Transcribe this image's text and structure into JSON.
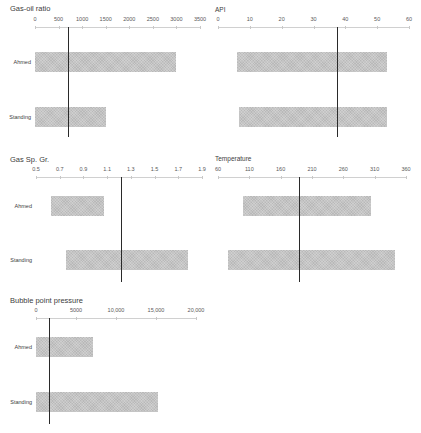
{
  "chart_data": [
    {
      "type": "bar",
      "orientation": "horizontal",
      "title": "Gas-oil ratio",
      "categories": [
        "Ahmed",
        "Standing"
      ],
      "ranges": [
        [
          0,
          3000
        ],
        [
          0,
          1500
        ]
      ],
      "reference_line": 700,
      "xlim": [
        0,
        3500
      ],
      "ticks": [
        "0",
        "500",
        "1000",
        "1500",
        "2000",
        "2500",
        "3000",
        "3500"
      ],
      "tick_values": [
        0,
        500,
        1000,
        1500,
        2000,
        2500,
        3000,
        3500
      ]
    },
    {
      "type": "bar",
      "orientation": "horizontal",
      "title": "API",
      "categories": [
        "Ahmed",
        "Standing"
      ],
      "ranges": [
        [
          6,
          53
        ],
        [
          6.5,
          53
        ]
      ],
      "reference_line": 37.5,
      "xlim": [
        0,
        60
      ],
      "ticks": [
        "0",
        "10",
        "20",
        "30",
        "40",
        "50",
        "60"
      ],
      "tick_values": [
        0,
        10,
        20,
        30,
        40,
        50,
        60
      ]
    },
    {
      "type": "bar",
      "orientation": "horizontal",
      "title": "Gas Sp. Gr.",
      "categories": [
        "Ahmed",
        "Standing"
      ],
      "ranges": [
        [
          0.63,
          1.07
        ],
        [
          0.75,
          1.78
        ]
      ],
      "reference_line": 1.22,
      "xlim": [
        0.5,
        1.9
      ],
      "ticks": [
        "0.5",
        "0.7",
        "0.9",
        "1.1",
        "1.3",
        "1.5",
        "1.7",
        "1.9"
      ],
      "tick_values": [
        0.5,
        0.7,
        0.9,
        1.1,
        1.3,
        1.5,
        1.7,
        1.9
      ]
    },
    {
      "type": "bar",
      "orientation": "horizontal",
      "title": "Temperature",
      "categories": [
        "Ahmed",
        "Standing"
      ],
      "ranges": [
        [
          100,
          304
        ],
        [
          76,
          342
        ]
      ],
      "reference_line": 190,
      "xlim": [
        60,
        360
      ],
      "ticks": [
        "60",
        "110",
        "160",
        "210",
        "260",
        "310",
        "360"
      ],
      "tick_values": [
        60,
        110,
        160,
        210,
        260,
        310,
        360
      ]
    },
    {
      "type": "bar",
      "orientation": "horizontal",
      "title": "Bubble point pressure",
      "categories": [
        "Ahmed",
        "Standing"
      ],
      "ranges": [
        [
          0,
          7100
        ],
        [
          0,
          15200
        ]
      ],
      "reference_line": 1600,
      "xlim": [
        0,
        20000
      ],
      "ticks": [
        "0",
        "5000",
        "10,000",
        "15,000",
        "20,000"
      ],
      "tick_values": [
        0,
        5000,
        10000,
        15000,
        20000
      ]
    }
  ],
  "style": {
    "bar_color": "#c4c4c4",
    "line_color": "#2a2a2a",
    "axis_color": "#d0d0d0"
  }
}
